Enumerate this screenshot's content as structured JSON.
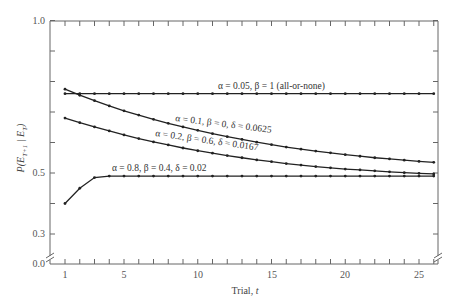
{
  "chart_data": {
    "type": "line",
    "title": "",
    "xlabel": "Trial, t",
    "ylabel": "P(E_{T+1} | E_T)",
    "xlim": [
      0,
      26.3
    ],
    "ylim": [
      0.0,
      1.0
    ],
    "y_axis_break": true,
    "grid": false,
    "x_ticks": [
      1,
      5,
      10,
      15,
      20,
      25
    ],
    "y_ticks": [
      {
        "value": 1.0,
        "label": "1.0"
      },
      {
        "value": 0.5,
        "label": "0.5"
      },
      {
        "value": 0.3,
        "label": "0.3"
      },
      {
        "value": 0.0,
        "label": "0.0"
      }
    ],
    "x": [
      1,
      2,
      3,
      4,
      5,
      6,
      7,
      8,
      9,
      10,
      11,
      12,
      13,
      14,
      15,
      16,
      17,
      18,
      19,
      20,
      21,
      22,
      23,
      24,
      25,
      26
    ],
    "series": [
      {
        "name": "α = 0.05, β = 1 (all-or-none)",
        "label": "α = 0.05, β = 1 (all-or-none)",
        "values": [
          0.76,
          0.76,
          0.76,
          0.76,
          0.76,
          0.76,
          0.76,
          0.76,
          0.76,
          0.76,
          0.76,
          0.76,
          0.76,
          0.76,
          0.76,
          0.76,
          0.76,
          0.76,
          0.76,
          0.76,
          0.76,
          0.76,
          0.76,
          0.76,
          0.76,
          0.76
        ]
      },
      {
        "name": "α = 0.1, β = 0, δ = 0.0625",
        "label": "α = 0.1, β = 0, δ = 0.0625",
        "values": [
          0.775,
          0.755,
          0.737,
          0.72,
          0.704,
          0.69,
          0.676,
          0.663,
          0.651,
          0.64,
          0.629,
          0.619,
          0.61,
          0.601,
          0.593,
          0.585,
          0.578,
          0.572,
          0.566,
          0.56,
          0.555,
          0.55,
          0.546,
          0.542,
          0.538,
          0.535
        ]
      },
      {
        "name": "α = 0.2, β = 0.6, δ = 0.0167",
        "label": "α = 0.2, β = 0.6, δ = 0.0167",
        "values": [
          0.68,
          0.665,
          0.651,
          0.638,
          0.625,
          0.613,
          0.602,
          0.592,
          0.582,
          0.573,
          0.565,
          0.557,
          0.55,
          0.543,
          0.537,
          0.531,
          0.526,
          0.521,
          0.517,
          0.513,
          0.51,
          0.507,
          0.504,
          0.501,
          0.499,
          0.497
        ]
      },
      {
        "name": "α = 0.8, β = 0.4, δ = 0.02",
        "label": "α = 0.8, β = 0.4, δ = 0.02",
        "values": [
          0.4,
          0.45,
          0.485,
          0.49,
          0.49,
          0.49,
          0.49,
          0.49,
          0.49,
          0.49,
          0.49,
          0.49,
          0.49,
          0.49,
          0.49,
          0.49,
          0.49,
          0.49,
          0.49,
          0.49,
          0.49,
          0.49,
          0.49,
          0.49,
          0.49,
          0.49
        ]
      }
    ],
    "legend": "inline labels on curves"
  },
  "labels": {
    "xlabel": "Trial, ",
    "xlabel_var": "t",
    "ylabel": "P(E",
    "y_tick_1_0": "1.0",
    "y_tick_0_5": "0.5",
    "y_tick_0_3": "0.3",
    "y_tick_0_0": "0.0",
    "x_tick_1": "1",
    "x_tick_5": "5",
    "x_tick_10": "10",
    "x_tick_15": "15",
    "x_tick_20": "20",
    "x_tick_25": "25",
    "curve_all_or_none": "α = 0.05, β = 1 (all-or-none)",
    "curve_a01": "α = 0.1, β = 0, δ = 0.0625",
    "curve_a02": "α = 0.2, β = 0.6, δ = 0.0167",
    "curve_a08": "α = 0.8, β = 0.4, δ = 0.02"
  }
}
